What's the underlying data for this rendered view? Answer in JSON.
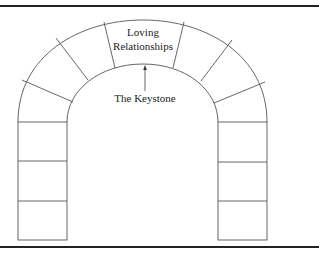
{
  "diagram": {
    "title": "",
    "keystone_label_line1": "Loving",
    "keystone_label_line2": "Relationships",
    "arrow_label": "The Keystone",
    "line_color": "#555555",
    "rule_color": "#222222"
  }
}
